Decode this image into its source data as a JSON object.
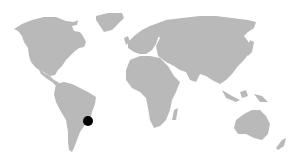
{
  "map": {
    "type": "world-map",
    "land_color": "#b9b9b9",
    "background_color": "#ffffff",
    "markers": [
      {
        "region": "South America (south-east Brazil)",
        "x": 88,
        "y": 121,
        "r": 5,
        "color": "#000000"
      }
    ]
  }
}
